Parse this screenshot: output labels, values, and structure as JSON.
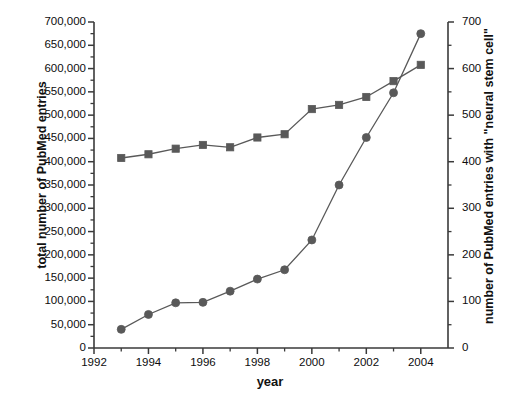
{
  "chart_data": {
    "type": "line",
    "title": "",
    "xlabel": "year",
    "ylabel": "total number of PubMed entries",
    "y2label": "number of PubMed entries with \"neural stem cell\"",
    "x": [
      1993,
      1994,
      1995,
      1996,
      1997,
      1998,
      1999,
      2000,
      2001,
      2002,
      2003,
      2004
    ],
    "xlim": [
      1992,
      2005
    ],
    "ylim": [
      0,
      700000
    ],
    "y2lim": [
      0,
      700
    ],
    "grid": false,
    "legend": "none",
    "xticks": [
      "1992",
      "1994",
      "1996",
      "1998",
      "2000",
      "2002",
      "2004"
    ],
    "xtick_values": [
      1992,
      1994,
      1996,
      1998,
      2000,
      2002,
      2004
    ],
    "xtick_minor_values": [
      1993,
      1995,
      1997,
      1999,
      2001,
      2003
    ],
    "yticks": [
      "0",
      "50,000",
      "100,000",
      "150,000",
      "200,000",
      "250,000",
      "300,000",
      "350,000",
      "400,000",
      "450,000",
      "500,000",
      "550,000",
      "600,000",
      "650,000",
      "700,000"
    ],
    "ytick_values": [
      0,
      50000,
      100000,
      150000,
      200000,
      250000,
      300000,
      350000,
      400000,
      450000,
      500000,
      550000,
      600000,
      650000,
      700000
    ],
    "y2ticks": [
      "0",
      "100",
      "200",
      "300",
      "400",
      "500",
      "600",
      "700"
    ],
    "y2tick_values": [
      0,
      100,
      200,
      300,
      400,
      450,
      500,
      600,
      700
    ],
    "y2tick_major_values": [
      0,
      100,
      200,
      300,
      400,
      500,
      600,
      700
    ],
    "y2tick_minor_values": [
      50,
      150,
      250,
      350,
      450,
      550,
      650
    ],
    "series": [
      {
        "name": "total number of PubMed entries",
        "axis": "left",
        "marker": "square",
        "color": "#595959",
        "values": [
          408000,
          416000,
          428000,
          436000,
          431000,
          452000,
          459000,
          513000,
          522000,
          539000,
          573000,
          608000
        ]
      },
      {
        "name": "number of PubMed entries with \"neural stem cell\"",
        "axis": "right",
        "marker": "circle",
        "color": "#595959",
        "values": [
          40,
          72,
          97,
          98,
          122,
          148,
          168,
          232,
          350,
          452,
          548,
          675
        ]
      }
    ]
  },
  "axes": {
    "left_title": "total number of PubMed entries",
    "right_title": "number of PubMed entries with \"neural stem cell\"",
    "x_title": "year"
  }
}
